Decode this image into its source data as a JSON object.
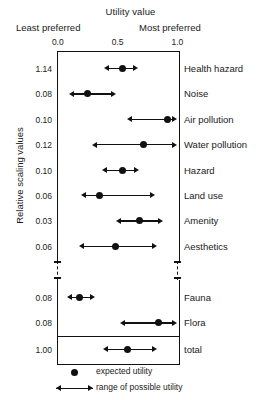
{
  "titles": {
    "x_axis": "Utility value",
    "least_preferred": "Least preferred",
    "most_preferred": "Most preferred",
    "y_axis": "Relative scaling values"
  },
  "xticks": [
    {
      "label": "0.0",
      "value": 0.0
    },
    {
      "label": "0.5",
      "value": 0.5
    },
    {
      "label": "1.0",
      "value": 1.0
    }
  ],
  "legend": {
    "dot": "expected utility",
    "range": "range of possible utility"
  },
  "chart_data": {
    "type": "scatter",
    "title": "Utility value",
    "xlabel": "Utility value",
    "ylabel": "Relative scaling values",
    "xlim": [
      0.0,
      1.0
    ],
    "xticks": [
      0.0,
      0.5,
      1.0
    ],
    "xtick_labels": [
      "0.0",
      "0.5",
      "1.0"
    ],
    "x_axis_endpoint_labels": [
      "Least preferred",
      "Most preferred"
    ],
    "grid": false,
    "legend_position": "below-axes",
    "legend_entries": [
      "expected utility",
      "range of possible utility"
    ],
    "axis_break": "dashed break between the 'Aesthetics' row and the 'Fauna' row on both vertical frame rails",
    "series": [
      {
        "name": "expected utility",
        "marker": "filled-circle"
      },
      {
        "name": "range of possible utility",
        "marker": "double-headed-arrow"
      }
    ],
    "categories": [
      "Health hazard",
      "Noise",
      "Air pollution",
      "Water pollution",
      "Hazard",
      "Land use",
      "Amenity",
      "Aesthetics",
      "Fauna",
      "Flora",
      "total"
    ],
    "relative_scaling_values": [
      "1.14",
      "0.08",
      "0.10",
      "0.12",
      "0.10",
      "0.06",
      "0.03",
      "0.06",
      "0.08",
      "0.08",
      "1.00"
    ],
    "rows": [
      {
        "label": "Health hazard",
        "scaling": "1.14",
        "expected": 0.54,
        "range": [
          0.39,
          0.67
        ],
        "group": "main"
      },
      {
        "label": "Noise",
        "scaling": "0.08",
        "expected": 0.25,
        "range": [
          0.09,
          0.49
        ],
        "group": "main"
      },
      {
        "label": "Air pollution",
        "scaling": "0.10",
        "expected": 0.92,
        "range": [
          0.58,
          1.0
        ],
        "group": "main"
      },
      {
        "label": "Water pollution",
        "scaling": "0.12",
        "expected": 0.72,
        "range": [
          0.29,
          1.0
        ],
        "group": "main"
      },
      {
        "label": "Hazard",
        "scaling": "0.10",
        "expected": 0.54,
        "range": [
          0.37,
          0.68
        ],
        "group": "main"
      },
      {
        "label": "Land use",
        "scaling": "0.06",
        "expected": 0.35,
        "range": [
          0.19,
          0.81
        ],
        "group": "main"
      },
      {
        "label": "Amenity",
        "scaling": "0.03",
        "expected": 0.68,
        "range": [
          0.49,
          0.88
        ],
        "group": "main"
      },
      {
        "label": "Aesthetics",
        "scaling": "0.06",
        "expected": 0.48,
        "range": [
          0.18,
          0.83
        ],
        "group": "main"
      },
      {
        "label": "Fauna",
        "scaling": "0.08",
        "expected": 0.18,
        "range": [
          0.08,
          0.31
        ],
        "group": "bio"
      },
      {
        "label": "Flora",
        "scaling": "0.08",
        "expected": 0.84,
        "range": [
          0.52,
          1.0
        ],
        "group": "bio"
      },
      {
        "label": "total",
        "scaling": "1.00",
        "expected": 0.58,
        "range": [
          0.38,
          0.83
        ],
        "group": "total"
      }
    ]
  }
}
